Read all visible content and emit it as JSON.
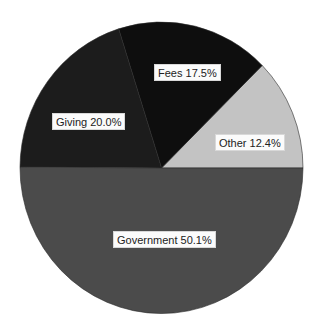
{
  "chart_data": {
    "type": "pie",
    "title": "",
    "start_angle_deg": 0,
    "direction": "counterclockwise",
    "slices": [
      {
        "name": "Other",
        "value": 12.4,
        "label": "Other 12.4%",
        "color": "#c3c3c3"
      },
      {
        "name": "Fees",
        "value": 17.5,
        "label": "Fees 17.5%",
        "color": "#0e0e0e"
      },
      {
        "name": "Giving",
        "value": 20.0,
        "label": "Giving 20.0%",
        "color": "#1c1c1c"
      },
      {
        "name": "Government",
        "value": 50.1,
        "label": "Government 50.1%",
        "color": "#4b4b4b"
      }
    ],
    "categories": [
      "Other",
      "Fees",
      "Giving",
      "Government"
    ],
    "values": [
      12.4,
      17.5,
      20.0,
      50.1
    ],
    "legend": "none (inline labels)",
    "units": "%"
  },
  "labels": {
    "other": "Other 12.4%",
    "fees": "Fees 17.5%",
    "giving": "Giving 20.0%",
    "government": "Government 50.1%"
  }
}
